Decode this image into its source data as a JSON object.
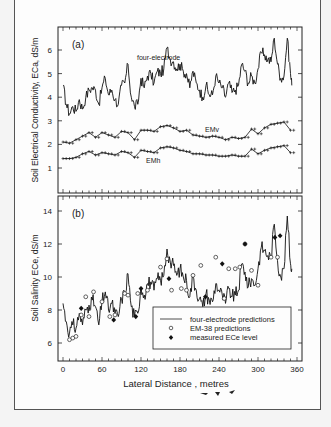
{
  "chart_data": [
    {
      "panel": "(a)",
      "type": "line",
      "ylabel": "Soil Electrical Conductivity, ECa, dS/m",
      "xlabel": "",
      "xlim": [
        0,
        360
      ],
      "ylim": [
        0,
        7
      ],
      "yticks": [
        1,
        2,
        3,
        4,
        5,
        6
      ],
      "xticks": [
        0,
        60,
        120,
        180,
        240,
        300,
        360
      ],
      "grid": false,
      "annotations": [
        "four-electrode",
        "EMv",
        "EMh"
      ],
      "series": [
        {
          "name": "four-electrode",
          "style": "line",
          "x": [
            0,
            5,
            10,
            15,
            20,
            25,
            30,
            35,
            40,
            45,
            50,
            55,
            60,
            65,
            70,
            75,
            80,
            85,
            90,
            95,
            100,
            105,
            110,
            115,
            120,
            125,
            130,
            135,
            140,
            145,
            150,
            155,
            160,
            165,
            170,
            175,
            180,
            185,
            190,
            195,
            200,
            205,
            210,
            215,
            220,
            225,
            230,
            235,
            240,
            245,
            250,
            255,
            260,
            265,
            270,
            275,
            280,
            285,
            290,
            295,
            300,
            305,
            310,
            315,
            320,
            325,
            330,
            335,
            340,
            345,
            350,
            352
          ],
          "y": [
            4.5,
            3.7,
            3.3,
            3.6,
            3.4,
            3.9,
            3.5,
            4.0,
            4.3,
            4.4,
            4.3,
            3.7,
            4.4,
            4.8,
            4.1,
            4.3,
            3.9,
            3.7,
            4.5,
            4.6,
            5.4,
            4.0,
            3.6,
            3.7,
            4.8,
            4.4,
            4.9,
            5.0,
            4.6,
            5.1,
            5.0,
            5.2,
            6.1,
            5.6,
            5.5,
            5.2,
            5.4,
            5.1,
            5.0,
            4.4,
            5.1,
            4.6,
            4.3,
            4.0,
            4.5,
            4.1,
            4.1,
            4.9,
            4.6,
            4.4,
            4.0,
            4.6,
            4.2,
            4.3,
            4.5,
            5.4,
            5.1,
            4.6,
            4.9,
            4.6,
            5.2,
            5.9,
            5.8,
            5.6,
            5.5,
            6.5,
            5.4,
            4.8,
            4.9,
            6.5,
            5.0,
            4.5
          ]
        },
        {
          "name": "EMv",
          "style": "line-plus",
          "x": [
            0,
            10,
            20,
            30,
            40,
            50,
            60,
            70,
            80,
            90,
            100,
            110,
            120,
            130,
            140,
            150,
            160,
            170,
            180,
            190,
            200,
            210,
            220,
            230,
            240,
            250,
            260,
            270,
            280,
            290,
            300,
            310,
            320,
            330,
            340,
            350
          ],
          "y": [
            2.1,
            2.05,
            2.2,
            2.35,
            2.5,
            2.3,
            2.5,
            2.4,
            2.3,
            2.55,
            2.5,
            2.2,
            2.6,
            2.6,
            2.55,
            2.75,
            2.8,
            2.7,
            2.55,
            2.6,
            2.4,
            2.35,
            2.3,
            2.35,
            2.3,
            2.2,
            2.3,
            2.25,
            2.3,
            2.65,
            2.45,
            2.7,
            2.85,
            2.9,
            2.95,
            2.6
          ]
        },
        {
          "name": "EMh",
          "style": "line-plus",
          "x": [
            0,
            10,
            20,
            30,
            40,
            50,
            60,
            70,
            80,
            90,
            100,
            110,
            120,
            130,
            140,
            150,
            160,
            170,
            180,
            190,
            200,
            210,
            220,
            230,
            240,
            250,
            260,
            270,
            280,
            290,
            300,
            310,
            320,
            330,
            340,
            350
          ],
          "y": [
            1.4,
            1.4,
            1.45,
            1.6,
            1.7,
            1.55,
            1.65,
            1.6,
            1.55,
            1.7,
            1.65,
            1.45,
            1.75,
            1.7,
            1.65,
            1.85,
            1.9,
            1.85,
            1.75,
            1.7,
            1.6,
            1.6,
            1.55,
            1.55,
            1.5,
            1.5,
            1.55,
            1.5,
            1.5,
            1.8,
            1.6,
            1.75,
            1.85,
            1.9,
            1.95,
            1.65
          ]
        }
      ]
    },
    {
      "panel": "(b)",
      "type": "line",
      "ylabel": "Soil Salinity ECe, dS/m",
      "xlabel": "Lateral Distance , metres",
      "xlim": [
        -10,
        365
      ],
      "ylim": [
        5,
        15
      ],
      "yticks": [
        6,
        8,
        10,
        12,
        14
      ],
      "xticks": [
        0,
        60,
        120,
        180,
        240,
        300,
        360
      ],
      "grid": false,
      "legend": {
        "placement": "lower-right",
        "entries": [
          "four-electrode predictions",
          "EM-38 predictions",
          "measured ECe level"
        ]
      },
      "series": [
        {
          "name": "four-electrode predictions",
          "style": "line",
          "x": [
            0,
            5,
            10,
            15,
            20,
            25,
            30,
            35,
            40,
            45,
            50,
            55,
            60,
            65,
            70,
            75,
            80,
            85,
            90,
            95,
            100,
            105,
            110,
            115,
            120,
            125,
            130,
            135,
            140,
            145,
            150,
            155,
            160,
            165,
            170,
            175,
            180,
            185,
            190,
            195,
            200,
            205,
            210,
            215,
            220,
            225,
            230,
            235,
            240,
            245,
            250,
            255,
            260,
            265,
            270,
            275,
            280,
            285,
            290,
            295,
            300,
            305,
            310,
            315,
            320,
            325,
            330,
            335,
            340,
            345,
            350,
            352
          ],
          "y": [
            8.4,
            7.3,
            6.6,
            7.1,
            6.9,
            7.8,
            7.1,
            8.0,
            8.3,
            8.6,
            8.2,
            7.1,
            8.5,
            9.1,
            8.0,
            8.4,
            7.8,
            7.6,
            8.7,
            9.0,
            10.2,
            8.2,
            7.6,
            7.8,
            9.4,
            8.9,
            9.6,
            9.7,
            9.2,
            9.9,
            9.8,
            10.1,
            11.7,
            10.9,
            10.7,
            10.1,
            10.5,
            10.0,
            9.8,
            8.8,
            10.0,
            9.2,
            8.7,
            8.2,
            9.0,
            8.6,
            8.5,
            9.6,
            9.2,
            8.9,
            8.4,
            9.3,
            8.8,
            8.9,
            9.2,
            10.8,
            10.3,
            9.4,
            9.9,
            9.5,
            10.5,
            11.8,
            11.6,
            11.3,
            11.2,
            13.2,
            11.0,
            10.0,
            10.5,
            13.7,
            10.8,
            10.5
          ]
        },
        {
          "name": "EM-38 predictions",
          "style": "open-circle",
          "x": [
            10,
            15,
            20,
            28,
            35,
            40,
            47,
            60,
            72,
            80,
            95,
            100,
            115,
            130,
            150,
            160,
            167,
            182,
            190,
            200,
            212,
            235,
            248,
            255,
            265,
            272,
            280,
            290,
            300,
            320,
            330
          ],
          "y": [
            6.2,
            6.3,
            6.4,
            7.7,
            8.8,
            7.6,
            9.1,
            8.5,
            7.6,
            7.7,
            9.0,
            8.9,
            9.0,
            9.2,
            10.6,
            11.1,
            9.2,
            9.3,
            9.2,
            10.1,
            10.7,
            11.2,
            8.7,
            10.5,
            10.5,
            10.6,
            12.0,
            10.4,
            9.5,
            11.2,
            11.2
          ]
        },
        {
          "name": "measured ECe level",
          "style": "filled-diamond",
          "x": [
            28,
            78,
            112,
            120,
            163,
            219,
            245,
            280,
            326,
            334
          ],
          "y": [
            8.1,
            7.4,
            7.6,
            9.3,
            9.9,
            8.8,
            10.8,
            12.0,
            12.4,
            12.5
          ]
        }
      ]
    }
  ],
  "labels": {
    "panel_a": "(a)",
    "panel_b": "(b)",
    "four_electrode": "four-electrode",
    "emv": "EMv",
    "emh": "EMh",
    "ylabel_a": "Soil Electrical Conductivity, ECa, dS/m",
    "ylabel_b": "Soil Salinity ECe, dS/m",
    "xlabel": "Lateral Distance , metres",
    "legend_line": "four-electrode predictions",
    "legend_open": "EM-38 predictions",
    "legend_filled": "measured ECe level"
  }
}
